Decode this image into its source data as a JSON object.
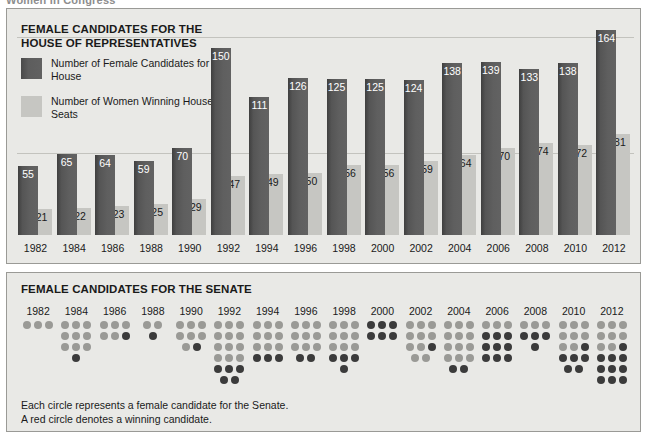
{
  "top_strip": {
    "text": "Women in Congress"
  },
  "house": {
    "title": "FEMALE CANDIDATES FOR THE HOUSE OF REPRESENTATIVES",
    "legend": [
      {
        "label": "Number of Female Candidates for the House",
        "color": "#5d5d5d",
        "swatch": "dark"
      },
      {
        "label": "Number of Women Winning House Seats",
        "color": "#c6c6c2",
        "swatch": "light"
      }
    ]
  },
  "senate": {
    "title": "FEMALE CANDIDATES FOR THE SENATE",
    "caption_line1": "Each circle represents a female candidate for the Senate.",
    "caption_line2": "A red circle denotes a winning candidate.",
    "dot_gray": "#9a9a96",
    "dot_red": "#3b3b3b"
  },
  "chart_data": [
    {
      "type": "bar",
      "title": "FEMALE CANDIDATES FOR THE HOUSE OF REPRESENTATIVES",
      "xlabel": "",
      "ylabel": "",
      "ylim": [
        0,
        170
      ],
      "grid": true,
      "legend_position": "top-left",
      "categories": [
        "1982",
        "1984",
        "1986",
        "1988",
        "1990",
        "1992",
        "1994",
        "1996",
        "1998",
        "2000",
        "2002",
        "2004",
        "2006",
        "2008",
        "2010",
        "2012"
      ],
      "series": [
        {
          "name": "Number of Female Candidates for the House",
          "color": "#5d5d5d",
          "values": [
            55,
            65,
            64,
            59,
            70,
            150,
            111,
            126,
            125,
            125,
            124,
            138,
            139,
            133,
            138,
            164
          ]
        },
        {
          "name": "Number of Women Winning House Seats",
          "color": "#c6c6c2",
          "values": [
            21,
            22,
            23,
            25,
            29,
            47,
            49,
            50,
            56,
            56,
            59,
            64,
            70,
            74,
            72,
            81
          ]
        }
      ]
    },
    {
      "type": "unit-dot",
      "title": "FEMALE CANDIDATES FOR THE SENATE",
      "xlabel": "",
      "ylabel": "",
      "unit": "1 circle = 1 female Senate candidate",
      "categories": [
        "1982",
        "1984",
        "1986",
        "1988",
        "1990",
        "1992",
        "1994",
        "1996",
        "1998",
        "2000",
        "2002",
        "2004",
        "2006",
        "2008",
        "2010",
        "2012"
      ],
      "series": [
        {
          "name": "Female candidates for the Senate",
          "color": "#9a9a96",
          "values": [
            3,
            10,
            6,
            2,
            8,
            17,
            12,
            11,
            13,
            6,
            11,
            14,
            12,
            7,
            14,
            18
          ]
        },
        {
          "name": "Winning candidates (red circles)",
          "color": "#3b3b3b",
          "values": [
            0,
            1,
            1,
            1,
            1,
            5,
            3,
            2,
            4,
            6,
            1,
            2,
            9,
            4,
            8,
            10
          ]
        }
      ],
      "columns": [
        {
          "year": "1982",
          "rows": [
            [
              "g",
              "g",
              "g"
            ]
          ]
        },
        {
          "year": "1984",
          "rows": [
            [
              "g",
              "g",
              "g"
            ],
            [
              "g",
              "g",
              "g"
            ],
            [
              "g",
              "g",
              "g"
            ],
            [
              "r"
            ]
          ]
        },
        {
          "year": "1986",
          "rows": [
            [
              "g",
              "g",
              "g"
            ],
            [
              "g",
              "g",
              "r"
            ]
          ]
        },
        {
          "year": "1988",
          "rows": [
            [
              "g",
              "g"
            ],
            [
              "r"
            ]
          ]
        },
        {
          "year": "1990",
          "rows": [
            [
              "g",
              "g",
              "g"
            ],
            [
              "g",
              "g",
              "g"
            ],
            [
              "g",
              "r"
            ]
          ]
        },
        {
          "year": "1992",
          "rows": [
            [
              "g",
              "g",
              "g"
            ],
            [
              "g",
              "g",
              "g"
            ],
            [
              "g",
              "g",
              "g"
            ],
            [
              "g",
              "g",
              "g"
            ],
            [
              "r",
              "r",
              "r"
            ],
            [
              "r",
              "r"
            ]
          ]
        },
        {
          "year": "1994",
          "rows": [
            [
              "g",
              "g",
              "g"
            ],
            [
              "g",
              "g",
              "g"
            ],
            [
              "g",
              "g",
              "g"
            ],
            [
              "r",
              "r",
              "r"
            ]
          ]
        },
        {
          "year": "1996",
          "rows": [
            [
              "g",
              "g",
              "g"
            ],
            [
              "g",
              "g",
              "g"
            ],
            [
              "g",
              "g",
              "g"
            ],
            [
              "r",
              "r"
            ]
          ]
        },
        {
          "year": "1998",
          "rows": [
            [
              "g",
              "g",
              "g"
            ],
            [
              "g",
              "g",
              "g"
            ],
            [
              "g",
              "g",
              "g"
            ],
            [
              "r",
              "r",
              "r"
            ],
            [
              "r"
            ]
          ]
        },
        {
          "year": "2000",
          "rows": [
            [
              "r",
              "r",
              "r"
            ],
            [
              "r",
              "r",
              "r"
            ]
          ]
        },
        {
          "year": "2002",
          "rows": [
            [
              "g",
              "g",
              "g"
            ],
            [
              "g",
              "g",
              "g"
            ],
            [
              "g",
              "g",
              "r"
            ],
            [
              "g",
              "g"
            ]
          ]
        },
        {
          "year": "2004",
          "rows": [
            [
              "g",
              "g",
              "g"
            ],
            [
              "g",
              "g",
              "g"
            ],
            [
              "g",
              "g",
              "g"
            ],
            [
              "g",
              "g",
              "g"
            ],
            [
              "r",
              "r"
            ]
          ]
        },
        {
          "year": "2006",
          "rows": [
            [
              "g",
              "g",
              "g"
            ],
            [
              "r",
              "r",
              "r"
            ],
            [
              "r",
              "r",
              "r"
            ],
            [
              "r",
              "r",
              "r"
            ]
          ]
        },
        {
          "year": "2008",
          "rows": [
            [
              "g",
              "g",
              "g"
            ],
            [
              "r",
              "r",
              "r"
            ],
            [
              "r"
            ]
          ]
        },
        {
          "year": "2010",
          "rows": [
            [
              "g",
              "g",
              "g"
            ],
            [
              "g",
              "g",
              "g"
            ],
            [
              "g",
              "g",
              "r"
            ],
            [
              "r",
              "r",
              "r"
            ],
            [
              "r",
              "r"
            ]
          ]
        },
        {
          "year": "2012",
          "rows": [
            [
              "g",
              "g",
              "g"
            ],
            [
              "g",
              "g",
              "g"
            ],
            [
              "g",
              "g",
              "r"
            ],
            [
              "r",
              "r",
              "r"
            ],
            [
              "r",
              "r",
              "r"
            ],
            [
              "r",
              "r",
              "r"
            ]
          ]
        }
      ]
    }
  ]
}
